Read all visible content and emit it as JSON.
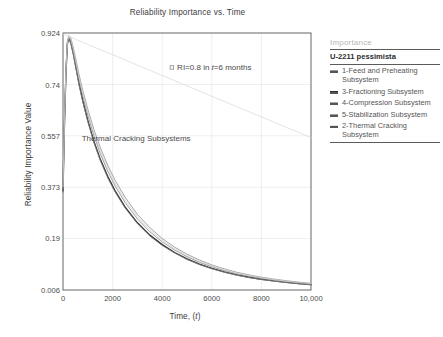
{
  "chart_data": {
    "type": "line",
    "title": "Reliability Importance vs. Time",
    "xlabel": "Time, (t)",
    "ylabel": "Reliability Importance Value",
    "xlim": [
      0,
      10000
    ],
    "ylim": [
      0.006,
      0.924
    ],
    "xticks": [
      "0",
      "2000",
      "4000",
      "6000",
      "8000",
      "10,000"
    ],
    "xtick_values": [
      0,
      2000,
      4000,
      6000,
      8000,
      10000
    ],
    "yticks": [
      "0.006",
      "0.19",
      "0.373",
      "0.557",
      "0.74",
      "0.924"
    ],
    "ytick_values": [
      0.006,
      0.19,
      0.373,
      0.557,
      0.74,
      0.924
    ],
    "grid": true,
    "legend_position": "right",
    "x": [
      0,
      60,
      120,
      180,
      240,
      320,
      400,
      500,
      650,
      800,
      1000,
      1250,
      1500,
      1800,
      2100,
      2500,
      3000,
      3500,
      4000,
      4500,
      5000,
      5500,
      6000,
      6500,
      7000,
      7500,
      8000,
      8500,
      9000,
      9500,
      10000
    ],
    "series": [
      {
        "name": "1-Feed and Preheating Subsystem",
        "color": "#9a9a9a",
        "width": 0.9,
        "values": [
          0.38,
          0.62,
          0.8,
          0.9,
          0.915,
          0.905,
          0.878,
          0.838,
          0.775,
          0.718,
          0.652,
          0.578,
          0.516,
          0.452,
          0.398,
          0.338,
          0.276,
          0.229,
          0.19,
          0.159,
          0.134,
          0.113,
          0.0955,
          0.0815,
          0.0695,
          0.06,
          0.0518,
          0.045,
          0.0392,
          0.0343,
          0.03
        ]
      },
      {
        "name": "3-Fractioning Subsystem",
        "color": "#2e2e2e",
        "width": 1.35,
        "values": [
          0.36,
          0.6,
          0.785,
          0.888,
          0.905,
          0.888,
          0.858,
          0.812,
          0.742,
          0.682,
          0.612,
          0.536,
          0.474,
          0.412,
          0.36,
          0.303,
          0.246,
          0.202,
          0.168,
          0.14,
          0.117,
          0.0985,
          0.0832,
          0.0706,
          0.0601,
          0.0516,
          0.0444,
          0.0384,
          0.0334,
          0.0291,
          0.0254
        ]
      },
      {
        "name": "4-Compression Subsystem",
        "color": "#8c8c8c",
        "width": 0.85,
        "values": [
          0.37,
          0.61,
          0.792,
          0.893,
          0.91,
          0.896,
          0.868,
          0.824,
          0.757,
          0.699,
          0.631,
          0.556,
          0.494,
          0.431,
          0.378,
          0.319,
          0.26,
          0.214,
          0.178,
          0.149,
          0.125,
          0.105,
          0.0889,
          0.0756,
          0.0644,
          0.0554,
          0.0477,
          0.0413,
          0.0359,
          0.0313,
          0.0274
        ]
      },
      {
        "name": "5-Stabilization Subsystem",
        "color": "#7e7e7e",
        "width": 0.85,
        "values": [
          0.355,
          0.598,
          0.783,
          0.886,
          0.903,
          0.885,
          0.854,
          0.808,
          0.737,
          0.677,
          0.607,
          0.531,
          0.469,
          0.407,
          0.356,
          0.299,
          0.243,
          0.199,
          0.165,
          0.138,
          0.115,
          0.0968,
          0.0818,
          0.0694,
          0.059,
          0.0506,
          0.0436,
          0.0377,
          0.0327,
          0.0285,
          0.0249
        ]
      },
      {
        "name": "2-Thermal Cracking Subsystem",
        "color": "#cfcfcf",
        "width": 0.8,
        "values": [
          0.375,
          0.615,
          0.797,
          0.896,
          0.912,
          0.9,
          0.872,
          0.83,
          0.765,
          0.708,
          0.641,
          0.567,
          0.505,
          0.441,
          0.388,
          0.328,
          0.268,
          0.221,
          0.184,
          0.154,
          0.129,
          0.109,
          0.0921,
          0.0784,
          0.0668,
          0.0576,
          0.0497,
          0.0431,
          0.0375,
          0.0328,
          0.0287
        ]
      },
      {
        "name": "reference-line",
        "color": "#dcdcdc",
        "width": 0.8,
        "values": [
          0.92,
          0.918,
          0.916,
          0.914,
          0.912,
          0.909,
          0.906,
          0.902,
          0.896,
          0.891,
          0.883,
          0.874,
          0.865,
          0.854,
          0.843,
          0.828,
          0.809,
          0.791,
          0.772,
          0.754,
          0.735,
          0.717,
          0.698,
          0.68,
          0.661,
          0.643,
          0.624,
          0.606,
          0.587,
          0.569,
          0.55
        ]
      }
    ],
    "annotations": [
      {
        "text": "RI=0.8 in t=6 months",
        "x": 4400,
        "y": 0.8,
        "marker": "square"
      },
      {
        "text": "Thermal Cracking Subsystems",
        "x": 4300,
        "y": 0.545,
        "marker": "none"
      }
    ]
  },
  "legend": {
    "title": "Importance",
    "subtitle": "U-2211 pessimista",
    "items": [
      {
        "label": "1-Feed and Preheating Subsystem",
        "color": "#9a9a9a",
        "width": "0.9px"
      },
      {
        "label": "3-Fractioning Subsystem",
        "color": "#2e2e2e",
        "width": "1.4px"
      },
      {
        "label": "4-Compression Subsystem",
        "color": "#a8a8a8",
        "width": "0.8px"
      },
      {
        "label": "5-Stabilization Subsystem",
        "color": "#9e9e9e",
        "width": "0.8px"
      },
      {
        "label": "2-Thermal Cracking Subsystem",
        "color": "#e2e2e2",
        "width": "0.8px"
      }
    ]
  }
}
